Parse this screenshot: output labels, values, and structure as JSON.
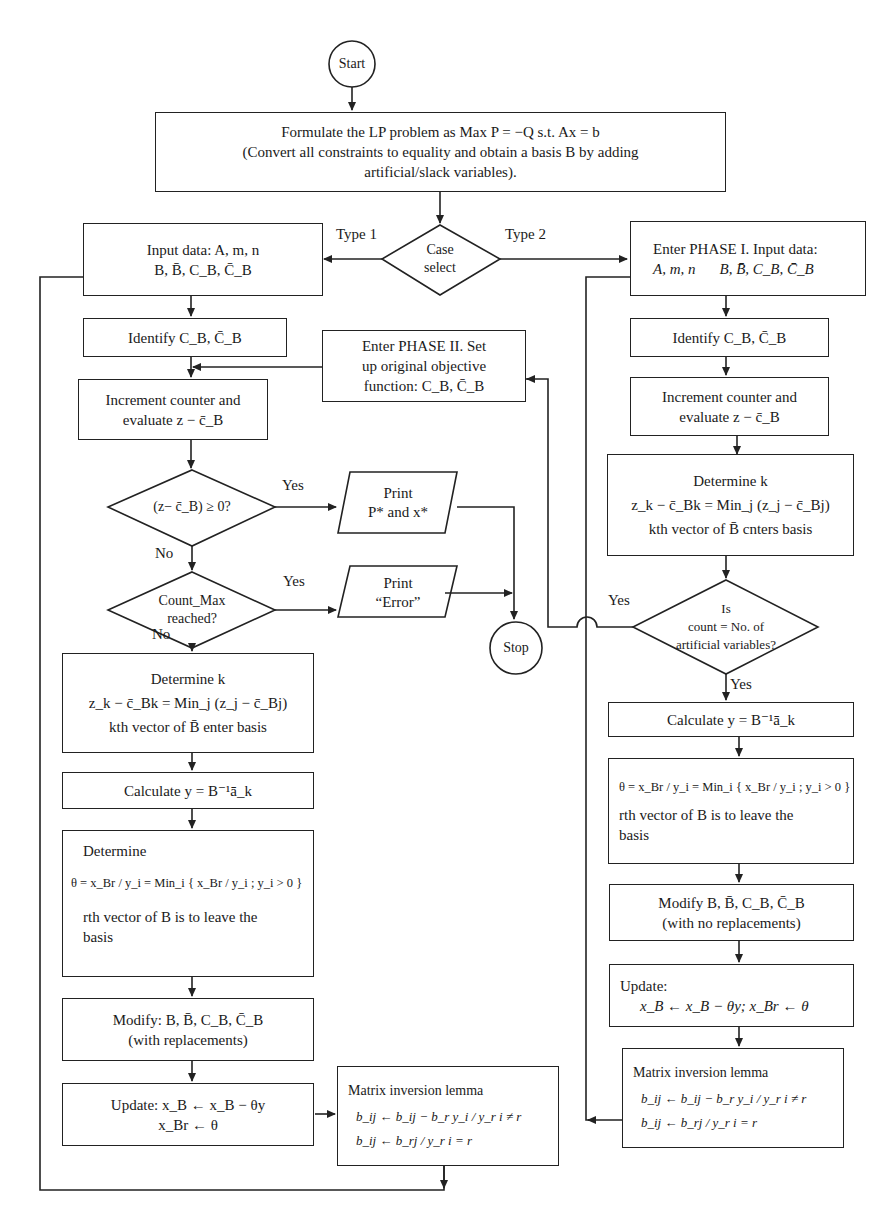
{
  "flowchart": {
    "start": "Start",
    "stop": "Stop",
    "formulate": {
      "line1": "Formulate the LP problem as Max P = −Q s.t. Ax = b",
      "line2": "(Convert all constraints to equality and obtain a basis B by adding",
      "line3": "artificial/slack variables)."
    },
    "case_select": {
      "line1": "Case",
      "line2": "select"
    },
    "branch_labels": {
      "type1": "Type 1",
      "type2": "Type 2"
    },
    "left": {
      "input": {
        "line1": "Input data: A, m, n",
        "line2": "B, B̄, C_B, C̄_B"
      },
      "identify": "Identify  C_B, C̄_B",
      "increment": {
        "line1": "Increment counter and",
        "line2": "evaluate z − c̄_B"
      },
      "decision_optimal": "(z− c̄_B) ≥ 0?",
      "decision_count": {
        "line1": "Count_Max",
        "line2": "reached?"
      },
      "determine_k": {
        "line1": "Determine k",
        "line2": "z_k − c̄_Bk = Min_j (z_j − c̄_Bj)",
        "line3": "kth vector of B̄ enter basis"
      },
      "calculate": "Calculate  y = B⁻¹ā_k",
      "determine_theta": {
        "line1": "Determine",
        "line2": "θ = x_Br / y_i = Min_i { x_Br / y_i ; y_i > 0 }",
        "line3": "rth vector of B is to leave the",
        "line4": "basis"
      },
      "modify": {
        "line1": "Modify: B, B̄, C_B, C̄_B",
        "line2": "(with replacements)"
      },
      "update": {
        "line1": "Update: x_B ← x_B − θy",
        "line2": "x_Br ← θ"
      },
      "matrix_lemma": {
        "title": "Matrix inversion lemma",
        "row1": "b_ij ← b_ij − b_r y_i / y_r      i ≠ r",
        "row2": "b_ij ← b_rj / y_r                   i = r"
      }
    },
    "middle": {
      "phase2": {
        "line1": "Enter PHASE II. Set",
        "line2": "up original objective",
        "line3": "function: C_B, C̄_B"
      },
      "print_result": {
        "line1": "Print",
        "line2": "P* and x*"
      },
      "print_error": {
        "line1": "Print",
        "line2": "“Error”"
      }
    },
    "right": {
      "phase1": {
        "line1": "Enter PHASE I. Input data:",
        "line2a": "A, m, n",
        "line2b": "B, B̄, C_B, C̄_B"
      },
      "identify": "Identify  C_B, C̄_B",
      "increment": {
        "line1": "Increment counter and",
        "line2": "evaluate z − c̄_B"
      },
      "determine_k": {
        "line1": "Determine k",
        "line2": "z_k − c̄_Bk = Min_j (z_j − c̄_Bj)",
        "line3": "kth vector of B̄ cnters basis"
      },
      "decision_artificial": {
        "line1": "Is",
        "line2": "count = No. of",
        "line3": "artificial variables?"
      },
      "calculate": "Calculate  y = B⁻¹ā_k",
      "theta": {
        "line1": "θ = x_Br / y_i = Min_i { x_Br / y_i ; y_i > 0 }",
        "line2": "rth vector of B is to leave the",
        "line3": "basis"
      },
      "modify": {
        "line1": "Modify B, B̄, C_B, C̄_B",
        "line2": "(with no replacements)"
      },
      "update": {
        "line1": "Update:",
        "line2": "x_B ← x_B − θy;  x_Br ← θ"
      },
      "matrix_lemma": {
        "title": "Matrix inversion lemma",
        "row1": "b_ij ← b_ij − b_r y_i / y_r      i ≠ r",
        "row2": "b_ij ← b_rj / y_r                   i = r"
      }
    },
    "edge_labels": {
      "yes": "Yes",
      "no": "No"
    }
  }
}
